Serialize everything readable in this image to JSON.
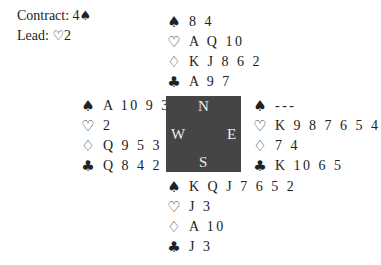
{
  "info": {
    "contract_label": "Contract: 4",
    "contract_suit": "♠",
    "lead_label": "Lead: ",
    "lead_suit": "♡",
    "lead_card": "2"
  },
  "compass": {
    "north": "N",
    "south": "S",
    "east": "E",
    "west": "W",
    "box_color": "#454545"
  },
  "suit_symbols": {
    "spades": "♠",
    "hearts": "♡",
    "diamonds": "♢",
    "clubs": "♣"
  },
  "hands": {
    "north": {
      "spades": "8 4",
      "hearts": "A Q 10",
      "diamonds": "K J 8 6 2",
      "clubs": "A 9 7"
    },
    "west": {
      "spades": "A 10 9 3",
      "hearts": "2",
      "diamonds": "Q 9 5 3",
      "clubs": "Q 8 4 2"
    },
    "east": {
      "spades": "---",
      "hearts": "K 9 8 7 6 5 4",
      "diamonds": "7 4",
      "clubs": "K 10 6 5"
    },
    "south": {
      "spades": "K Q J 7 6 5 2",
      "hearts": "J 3",
      "diamonds": "A 10",
      "clubs": "J 3"
    }
  }
}
